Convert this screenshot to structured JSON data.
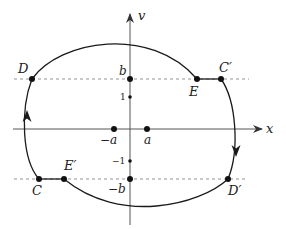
{
  "diagram": {
    "type": "phase-plane closed curve",
    "axes": {
      "horizontal_label": "x",
      "vertical_label": "v"
    },
    "tick_labels": {
      "b": "b",
      "one": "1",
      "minus_one": "−1",
      "minus_b": "−b",
      "a": "a",
      "minus_a": "−a"
    },
    "points": {
      "D": "D",
      "E": "E",
      "C_prime": "C′",
      "C": "C",
      "E_prime": "E′",
      "D_prime": "D′"
    },
    "colors": {
      "curve": "#1a1a1a",
      "axis": "#555555",
      "dashed": "#888888"
    }
  }
}
